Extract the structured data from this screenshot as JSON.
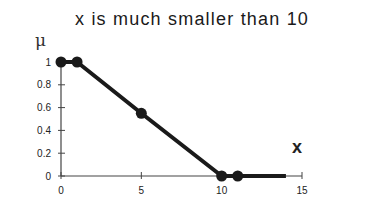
{
  "chart_data": {
    "type": "line",
    "title": "x is much smaller than 10",
    "xlabel": "x",
    "ylabel": "μ",
    "xlim": [
      0,
      15
    ],
    "ylim": [
      0,
      1
    ],
    "x_ticks": [
      "0",
      "5",
      "10",
      "15"
    ],
    "y_ticks": [
      "0",
      "0.2",
      "0.4",
      "0.6",
      "0.8",
      "1"
    ],
    "grid": false,
    "legend": null,
    "series": [
      {
        "name": "membership",
        "x": [
          0,
          1,
          5,
          10,
          11,
          14
        ],
        "y": [
          1,
          1,
          0.55,
          0,
          0,
          0
        ],
        "markers_at": [
          0,
          1,
          5,
          10,
          11
        ]
      }
    ],
    "color": "#1a1a1a"
  }
}
